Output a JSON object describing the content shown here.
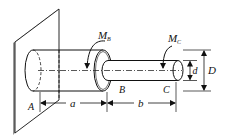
{
  "diagram": {
    "type": "stepped-shaft-torsion",
    "labels": {
      "point_a": "A",
      "point_b": "B",
      "point_c": "C",
      "moment_b": "M",
      "moment_b_sub": "B",
      "moment_c": "M",
      "moment_c_sub": "C",
      "length_a": "a",
      "length_b": "b",
      "diameter_small": "d",
      "diameter_large": "D"
    },
    "colors": {
      "line": "#111111",
      "wall_shade": "#9a9a9a",
      "background": "#ffffff"
    }
  }
}
